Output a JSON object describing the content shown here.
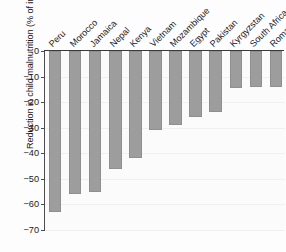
{
  "chart_data": {
    "type": "bar",
    "title": "",
    "xlabel": "",
    "ylabel": "Reduction in child malnutrition (% of initial value)",
    "ylim": [
      -70,
      0
    ],
    "yticks": [
      0,
      -10,
      -20,
      -30,
      -40,
      -50,
      -60,
      -70
    ],
    "ytick_labels": [
      "0",
      "−10",
      "−20",
      "−30",
      "−40",
      "−50",
      "−60",
      "−70"
    ],
    "grid": true,
    "legend": "none",
    "orientation": "vertical",
    "bar_color": "#9d9d9d",
    "axis_color": "#3a3a3a",
    "categories": [
      "Peru",
      "Morocco",
      "Jamaica",
      "Nepal",
      "Kenya",
      "Vietnam",
      "Mozambique",
      "Egypt",
      "Pakistan",
      "Kyrgyzstan",
      "South Africa",
      "Romania"
    ],
    "values": [
      -63,
      -56,
      -55,
      -46,
      -42,
      -31,
      -29,
      -26,
      -24,
      -14.5,
      -14,
      -14
    ]
  },
  "caption": ""
}
